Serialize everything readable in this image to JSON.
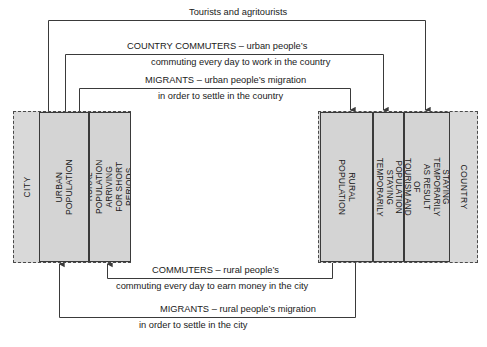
{
  "diagram": {
    "colors": {
      "block_fill": "#d4d4d4",
      "region_fill": "#d9d9d9",
      "line": "#3a3a3a",
      "text": "#1a1a1a"
    }
  },
  "regions": [
    {
      "id": "city",
      "name": "CITY"
    },
    {
      "id": "country",
      "name": "COUNTRY"
    }
  ],
  "blocks": {
    "city": [
      {
        "id": "urban-population",
        "label": "URBAN\nPOPULATION"
      },
      {
        "id": "rural-short-stay",
        "label": "RURAL POPULATION ARRIVING\nFOR SHORT PERIODS"
      }
    ],
    "country": [
      {
        "id": "rural-population",
        "label": "RURAL POPULATION"
      },
      {
        "id": "urban-temp-work",
        "label": "URBAN POPULATION STAYING\nTEMPORARILY (WORK)"
      },
      {
        "id": "pop-tourism",
        "label": "POPULATION STAYING\nTEMPORARILY AS RESULT OF\nTOURISM AND AGRITOURISM"
      }
    ]
  },
  "flows": [
    {
      "id": "tourists",
      "direction": "city-to-country",
      "line1": "Tourists and agritourists",
      "line2": ""
    },
    {
      "id": "country-commuters",
      "direction": "city-to-country",
      "line1": "COUNTRY COMMUTERS – urban people’s",
      "line2": "commuting every day to work in the country"
    },
    {
      "id": "migrants-urban",
      "direction": "city-to-country",
      "line1": "MIGRANTS – urban people’s migration",
      "line2": "in order to settle in the country"
    },
    {
      "id": "commuters-rural",
      "direction": "country-to-city",
      "line1": "COMMUTERS – rural people’s",
      "line2": "commuting every day to earn money in the city"
    },
    {
      "id": "migrants-rural",
      "direction": "country-to-city",
      "line1": "MIGRANTS – rural people’s migration",
      "line2": "in order to settle in the city"
    }
  ]
}
